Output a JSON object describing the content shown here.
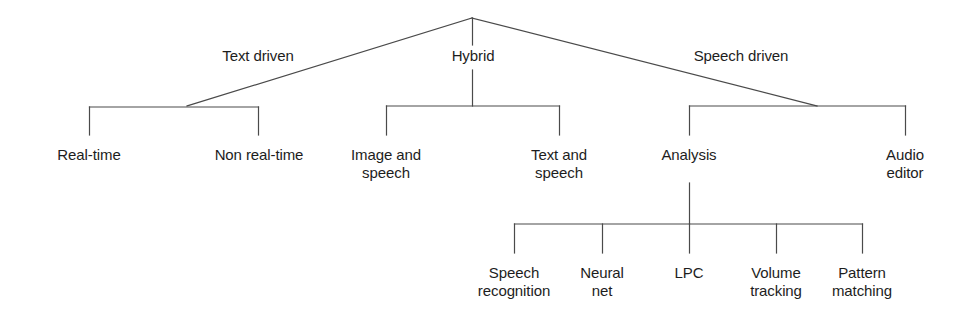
{
  "diagram": {
    "stroke_color": "#4a4a4a",
    "text_color": "#1d1d1d",
    "background_color": "#ffffff",
    "root": {
      "label": ""
    },
    "edge_labels": [
      {
        "id": "text-driven",
        "text": "Text driven"
      },
      {
        "id": "hybrid",
        "text": "Hybrid"
      },
      {
        "id": "speech-driven",
        "text": "Speech driven"
      }
    ],
    "level2": [
      {
        "id": "real-time",
        "text": "Real-time"
      },
      {
        "id": "non-real-time",
        "text": "Non real-time"
      },
      {
        "id": "image-and-speech",
        "text": "Image and\nspeech"
      },
      {
        "id": "text-and-speech",
        "text": "Text and\nspeech"
      },
      {
        "id": "analysis",
        "text": "Analysis"
      },
      {
        "id": "audio-editor",
        "text": "Audio\neditor"
      }
    ],
    "level3": [
      {
        "id": "speech-recognition",
        "text": "Speech\nrecognition"
      },
      {
        "id": "neural-net",
        "text": "Neural\nnet"
      },
      {
        "id": "lpc",
        "text": "LPC"
      },
      {
        "id": "volume-tracking",
        "text": "Volume\ntracking"
      },
      {
        "id": "pattern-matching",
        "text": "Pattern\nmatching"
      }
    ]
  }
}
